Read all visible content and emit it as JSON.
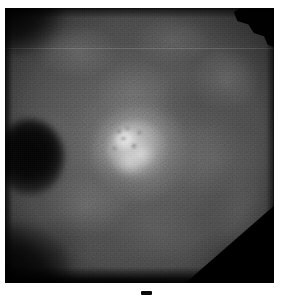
{
  "image": {
    "modality": "fundus-fluorescein-angiography",
    "colorspace": "grayscale",
    "width_px": 282,
    "height_px": 299,
    "plate": {
      "left_px": 5,
      "top_px": 8,
      "width_px": 269,
      "height_px": 275
    },
    "background_color": "#ffffff",
    "field_color": "#4e4e4e",
    "shadow_color": "#000000",
    "highlight_color": "#f6f6f6"
  },
  "features": {
    "central_lesion": {
      "name": "hyperfluorescent-lesion",
      "center_x_px": 125,
      "center_y_px": 140,
      "core_color": "#f6f6f6",
      "halo_color": "#cdcdcd"
    },
    "dark_blob": {
      "name": "hypofluorescent-blob",
      "center_x_px": 25,
      "center_y_px": 149,
      "color": "#000000"
    },
    "scan_line": {
      "name": "horizontal-scan-line",
      "y_px": 48,
      "color": "#bebebe"
    },
    "corner_notch": {
      "name": "top-right-corner-notch",
      "color": "#010101"
    },
    "corner_cut": {
      "name": "bottom-right-corner-cut",
      "color": "#000000"
    },
    "tick_mark": {
      "name": "bottom-center-tick-mark",
      "x_px": 141,
      "y_px": 291,
      "color": "#0a0a0a"
    }
  },
  "speckles": [
    {
      "left": 117,
      "top": 130,
      "w": 4,
      "h": 3
    },
    {
      "left": 126,
      "top": 127,
      "w": 3,
      "h": 3
    },
    {
      "left": 121,
      "top": 137,
      "w": 5,
      "h": 3
    },
    {
      "left": 132,
      "top": 144,
      "w": 4,
      "h": 4
    },
    {
      "left": 113,
      "top": 147,
      "w": 3,
      "h": 3
    },
    {
      "left": 138,
      "top": 131,
      "w": 3,
      "h": 3
    }
  ]
}
